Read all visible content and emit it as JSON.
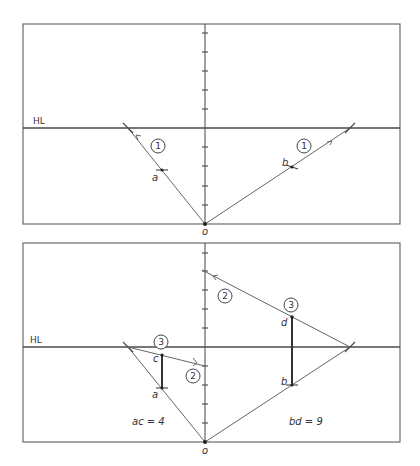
{
  "diagram": {
    "type": "perspective-construction",
    "panels": [
      {
        "id": "upper",
        "horizon_label": "HL",
        "origin_label": "o",
        "point_labels": {
          "a": "a",
          "b": "b"
        },
        "step_markers": [
          "1",
          "1"
        ]
      },
      {
        "id": "lower",
        "horizon_label": "HL",
        "origin_label": "o",
        "point_labels": {
          "a": "a",
          "b": "b",
          "c": "c",
          "d": "d"
        },
        "step_markers": [
          "2",
          "2",
          "3",
          "3"
        ],
        "equations": {
          "left": "ac = 4",
          "right": "bd = 9"
        }
      }
    ]
  }
}
